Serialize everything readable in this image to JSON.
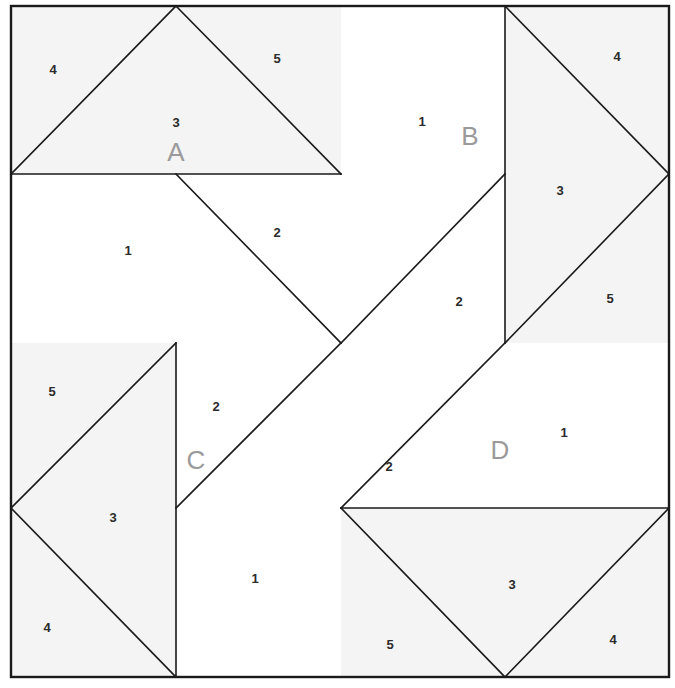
{
  "figure": {
    "background_color": "#ffffff",
    "shaded_fill": "#f4f4f4",
    "white_fill": "#ffffff",
    "line_color": "#1a1a1a",
    "number_color": "#2b2b2b",
    "letter_color": "#9a9a9a",
    "outer_frame": {
      "x": 11,
      "y": 6,
      "width": 658,
      "height": 671
    },
    "center_point": {
      "x": 341,
      "y": 343
    }
  },
  "quadrants": [
    {
      "id": "A",
      "label": "A",
      "label_pos": {
        "x": 176,
        "y": 154
      },
      "rotation_deg": 0,
      "bounds": {
        "x": 11,
        "y": 6,
        "width": 330,
        "height": 337
      },
      "pieces": [
        {
          "number": "1",
          "pos": {
            "x": 128,
            "y": 252
          },
          "shaded": false
        },
        {
          "number": "2",
          "pos": {
            "x": 277,
            "y": 234
          },
          "shaded": false
        },
        {
          "number": "3",
          "pos": {
            "x": 176,
            "y": 124
          },
          "shaded": true
        },
        {
          "number": "4",
          "pos": {
            "x": 53,
            "y": 71
          },
          "shaded": true
        },
        {
          "number": "5",
          "pos": {
            "x": 277,
            "y": 60
          },
          "shaded": true
        }
      ]
    },
    {
      "id": "B",
      "label": "B",
      "label_pos": {
        "x": 470,
        "y": 138
      },
      "rotation_deg": 90,
      "bounds": {
        "x": 341,
        "y": 6,
        "width": 328,
        "height": 337
      },
      "pieces": [
        {
          "number": "1",
          "pos": {
            "x": 422,
            "y": 123
          },
          "shaded": false
        },
        {
          "number": "2",
          "pos": {
            "x": 459,
            "y": 303
          },
          "shaded": false
        },
        {
          "number": "3",
          "pos": {
            "x": 560,
            "y": 192
          },
          "shaded": true
        },
        {
          "number": "4",
          "pos": {
            "x": 617,
            "y": 58
          },
          "shaded": true
        },
        {
          "number": "5",
          "pos": {
            "x": 610,
            "y": 300
          },
          "shaded": true
        }
      ]
    },
    {
      "id": "C",
      "label": "C",
      "label_pos": {
        "x": 196,
        "y": 462
      },
      "rotation_deg": 270,
      "bounds": {
        "x": 11,
        "y": 343,
        "width": 330,
        "height": 334
      },
      "pieces": [
        {
          "number": "1",
          "pos": {
            "x": 255,
            "y": 580
          },
          "shaded": false
        },
        {
          "number": "2",
          "pos": {
            "x": 216,
            "y": 408
          },
          "shaded": false
        },
        {
          "number": "3",
          "pos": {
            "x": 113,
            "y": 519
          },
          "shaded": true
        },
        {
          "number": "4",
          "pos": {
            "x": 47,
            "y": 629
          },
          "shaded": true
        },
        {
          "number": "5",
          "pos": {
            "x": 52,
            "y": 393
          },
          "shaded": true
        }
      ]
    },
    {
      "id": "D",
      "label": "D",
      "label_pos": {
        "x": 500,
        "y": 452
      },
      "rotation_deg": 180,
      "bounds": {
        "x": 341,
        "y": 343,
        "width": 328,
        "height": 334
      },
      "pieces": [
        {
          "number": "1",
          "pos": {
            "x": 564,
            "y": 434
          },
          "shaded": false
        },
        {
          "number": "2",
          "pos": {
            "x": 389,
            "y": 468
          },
          "shaded": false
        },
        {
          "number": "3",
          "pos": {
            "x": 512,
            "y": 586
          },
          "shaded": true
        },
        {
          "number": "4",
          "pos": {
            "x": 613,
            "y": 641
          },
          "shaded": true
        },
        {
          "number": "5",
          "pos": {
            "x": 390,
            "y": 646
          },
          "shaded": true
        }
      ]
    }
  ],
  "geometry": {
    "shaded_polygons": [
      "11,6 341,6 341,174 11,174",
      "341,6 669,6 669,343 505,343 505,6",
      "11,343 176,343 176,677 11,677",
      "341,508 669,508 669,677 341,677"
    ],
    "white_polygons": [
      "11,174 341,174 341,343 11,343",
      "341,6 505,6 505,343 341,343",
      "176,343 341,343 341,677 176,677",
      "341,343 669,343 669,508 341,508"
    ],
    "internal_lines": [
      "11,174 176,6",
      "176,6 341,174",
      "11,174 341,174",
      "176,174 341,343",
      "505,6 669,174",
      "669,174 505,343",
      "505,6 505,343",
      "341,343 505,174",
      "176,343 11,508",
      "11,508 176,677",
      "176,343 176,677",
      "341,343 176,508",
      "341,508 505,677",
      "505,677 669,508",
      "341,508 669,508",
      "505,343 341,508"
    ]
  }
}
